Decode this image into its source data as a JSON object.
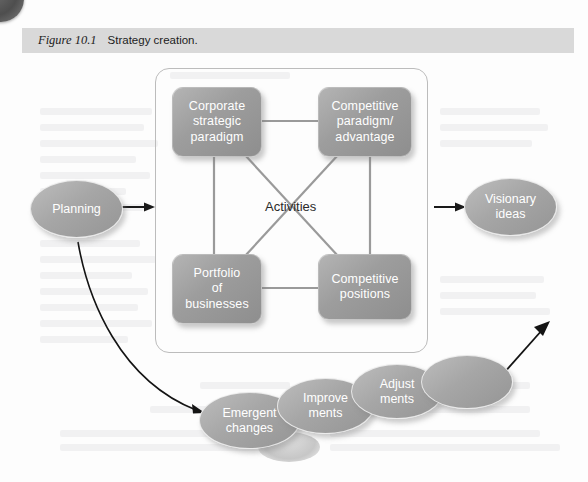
{
  "caption": {
    "figure_number": "Figure 10.1",
    "title": "Strategy creation."
  },
  "diagram": {
    "center_label": "Activities",
    "boxes": [
      {
        "id": "corporate-strategic-paradigm",
        "label": "Corporate\nstrategic\nparadigm"
      },
      {
        "id": "competitive-paradigm-advantage",
        "label": "Competitive\nparadigm/\nadvantage"
      },
      {
        "id": "portfolio-of-businesses",
        "label": "Portfolio\nof\nbusinesses"
      },
      {
        "id": "competitive-positions",
        "label": "Competitive\npositions"
      }
    ],
    "input_node": {
      "id": "planning",
      "label": "Planning"
    },
    "output_node": {
      "id": "visionary-ideas",
      "label": "Visionary\nideas"
    },
    "emergent_chain": [
      {
        "id": "emergent-changes",
        "label": "Emergent\nchanges"
      },
      {
        "id": "improvements",
        "label": "Improve\nments"
      },
      {
        "id": "adjustments",
        "label": "Adjust\nments"
      },
      {
        "id": "unlabelled-ellipse",
        "label": ""
      }
    ]
  },
  "colors": {
    "caption_band": "#d9d9d9",
    "node_fill": "#a6a6a6",
    "node_text": "#ffffff",
    "frame_border": "#bcbcbc",
    "connector": "#9a9a9a",
    "arrow": "#1a1a1a"
  }
}
